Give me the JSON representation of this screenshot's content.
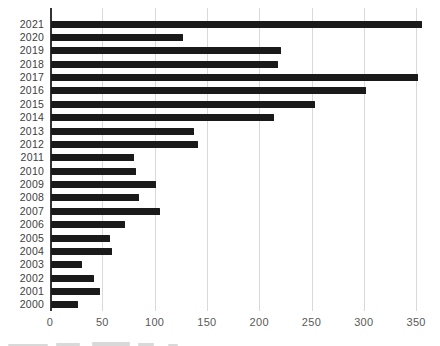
{
  "chart_data": {
    "type": "bar",
    "orientation": "horizontal",
    "title": "",
    "xlabel": "",
    "ylabel": "",
    "categories": [
      "2021",
      "2020",
      "2019",
      "2018",
      "2017",
      "2016",
      "2015",
      "2014",
      "2013",
      "2012",
      "2011",
      "2010",
      "2009",
      "2008",
      "2007",
      "2006",
      "2005",
      "2004",
      "2003",
      "2002",
      "2001",
      "2000"
    ],
    "values": [
      355,
      126,
      220,
      217,
      351,
      301,
      252,
      213,
      137,
      141,
      79,
      81,
      100,
      84,
      104,
      71,
      56,
      58,
      30,
      41,
      47,
      26
    ],
    "xticks": [
      0,
      50,
      100,
      150,
      200,
      250,
      300,
      350
    ],
    "xlim": [
      0,
      364
    ],
    "grid": true,
    "legend": "none",
    "colors": {
      "bar": "#1a1a1a",
      "axis_line": "#333333",
      "gridline": "#d9d9d9",
      "category_labels": "#404040",
      "tick_labels": "#595959",
      "background": "#ffffff"
    }
  }
}
